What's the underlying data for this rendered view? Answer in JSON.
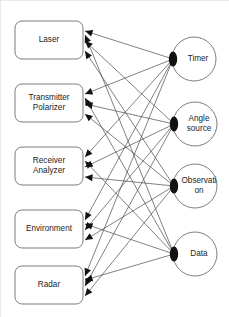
{
  "diagram": {
    "type": "directed-graph",
    "title": "",
    "background_color": "#ffffff",
    "edge_color": "#4a4a4a",
    "node_stroke_color": "#7d7d7d",
    "node_fill_color": "#ffffff",
    "arrow_color": "#111111",
    "text_color": "#1c1c1c"
  },
  "boxes": [
    {
      "id": "laser",
      "label": "Laser",
      "lines": [
        "Laser"
      ],
      "shape": "rounded-rectangle",
      "x": 14,
      "y": 20,
      "w": 68,
      "h": 38,
      "incoming_count": 3
    },
    {
      "id": "transmitter-polarizer",
      "label": "Transmitter Polarizer",
      "lines": [
        "Transmitter",
        "Polarizer"
      ],
      "shape": "rounded-rectangle",
      "x": 14,
      "y": 83,
      "w": 68,
      "h": 38,
      "incoming_count": 3
    },
    {
      "id": "receiver-analyzer",
      "label": "Receiver Analyzer",
      "lines": [
        "Receiver",
        "Analyzer"
      ],
      "shape": "rounded-rectangle",
      "x": 14,
      "y": 146,
      "w": 68,
      "h": 38,
      "incoming_count": 3
    },
    {
      "id": "environment",
      "label": "Environment",
      "lines": [
        "Environment"
      ],
      "shape": "rounded-rectangle",
      "x": 14,
      "y": 209,
      "w": 68,
      "h": 38,
      "incoming_count": 3
    },
    {
      "id": "radar",
      "label": "Radar",
      "lines": [
        "Radar"
      ],
      "shape": "rounded-rectangle",
      "x": 14,
      "y": 265,
      "w": 68,
      "h": 38,
      "incoming_count": 3
    }
  ],
  "circles": [
    {
      "id": "timer",
      "label": "Timer",
      "lines": [
        "Timer"
      ],
      "shape": "circle",
      "cx": 193,
      "cy": 58,
      "r": 22,
      "outgoing_count": 5
    },
    {
      "id": "angle-source",
      "label": "Angle source",
      "lines": [
        "Angle",
        "source"
      ],
      "shape": "circle",
      "cx": 194,
      "cy": 123,
      "r": 22,
      "outgoing_count": 5
    },
    {
      "id": "observation",
      "label": "Observation",
      "lines": [
        "Observati",
        "on"
      ],
      "shape": "circle",
      "cx": 194,
      "cy": 185,
      "r": 22,
      "outgoing_count": 5
    },
    {
      "id": "data",
      "label": "Data",
      "lines": [
        "Data"
      ],
      "shape": "circle",
      "cx": 194,
      "cy": 253,
      "r": 22,
      "outgoing_count": 5
    }
  ],
  "edges": [
    {
      "from": "timer",
      "to": "laser",
      "sx": 172,
      "sy": 58,
      "tx": 84,
      "ty": 30
    },
    {
      "from": "timer",
      "to": "transmitter-polarizer",
      "sx": 172,
      "sy": 58,
      "tx": 84,
      "ty": 93
    },
    {
      "from": "timer",
      "to": "receiver-analyzer",
      "sx": 172,
      "sy": 58,
      "tx": 84,
      "ty": 156
    },
    {
      "from": "timer",
      "to": "environment",
      "sx": 172,
      "sy": 58,
      "tx": 84,
      "ty": 219
    },
    {
      "from": "timer",
      "to": "radar",
      "sx": 172,
      "sy": 58,
      "tx": 84,
      "ty": 275
    },
    {
      "from": "angle-source",
      "to": "laser",
      "sx": 173,
      "sy": 123,
      "tx": 84,
      "ty": 40
    },
    {
      "from": "angle-source",
      "to": "transmitter-polarizer",
      "sx": 173,
      "sy": 123,
      "tx": 84,
      "ty": 103
    },
    {
      "from": "angle-source",
      "to": "receiver-analyzer",
      "sx": 173,
      "sy": 123,
      "tx": 84,
      "ty": 166
    },
    {
      "from": "angle-source",
      "to": "environment",
      "sx": 173,
      "sy": 123,
      "tx": 84,
      "ty": 229
    },
    {
      "from": "angle-source",
      "to": "radar",
      "sx": 173,
      "sy": 123,
      "tx": 84,
      "ty": 285
    },
    {
      "from": "observation",
      "to": "laser",
      "sx": 173,
      "sy": 185,
      "tx": 84,
      "ty": 50
    },
    {
      "from": "observation",
      "to": "transmitter-polarizer",
      "sx": 173,
      "sy": 185,
      "tx": 84,
      "ty": 113
    },
    {
      "from": "observation",
      "to": "receiver-analyzer",
      "sx": 173,
      "sy": 185,
      "tx": 84,
      "ty": 176
    },
    {
      "from": "observation",
      "to": "environment",
      "sx": 173,
      "sy": 185,
      "tx": 84,
      "ty": 239
    },
    {
      "from": "observation",
      "to": "radar",
      "sx": 173,
      "sy": 185,
      "tx": 84,
      "ty": 295
    },
    {
      "from": "data",
      "to": "laser",
      "sx": 173,
      "sy": 253,
      "tx": 84,
      "ty": 34
    },
    {
      "from": "data",
      "to": "transmitter-polarizer",
      "sx": 173,
      "sy": 253,
      "tx": 84,
      "ty": 97
    },
    {
      "from": "data",
      "to": "receiver-analyzer",
      "sx": 173,
      "sy": 253,
      "tx": 84,
      "ty": 160
    },
    {
      "from": "data",
      "to": "environment",
      "sx": 173,
      "sy": 253,
      "tx": 84,
      "ty": 223
    },
    {
      "from": "data",
      "to": "radar",
      "sx": 173,
      "sy": 253,
      "tx": 84,
      "ty": 279
    }
  ]
}
